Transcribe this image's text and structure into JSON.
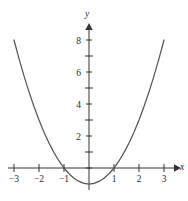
{
  "figure": {
    "background_color": "#ffffff",
    "curve_color": "#555555",
    "axis_color": "#333333",
    "text_color": "#2b2b2b"
  },
  "axes": {
    "x_axis_name": "x",
    "y_axis_name": "y",
    "x_tick_labels": [
      "−3",
      "−2",
      "−1",
      "1",
      "2",
      "3"
    ],
    "y_tick_labels": [
      "2",
      "4",
      "6",
      "8"
    ]
  },
  "top_strip": {
    "faint_cropped_text": "·   ·   ·   · ·   ·   ·"
  },
  "chart_data": {
    "type": "line",
    "title": "",
    "subtitle": "",
    "xlabel": "x",
    "ylabel": "y",
    "equation": "y = x² − 1",
    "xlim": [
      -3.4,
      3.4
    ],
    "ylim": [
      -1.8,
      8.9
    ],
    "xticks": [
      -3,
      -2,
      -1,
      1,
      2,
      3
    ],
    "yticks": [
      2,
      4,
      6,
      8
    ],
    "x_minor_ticks": [],
    "y_minor_ticks": [
      1,
      3,
      5,
      7
    ],
    "grid": false,
    "legend": false,
    "legend_position": "none",
    "x_intercepts": [
      -1,
      1
    ],
    "y_intercept": -1,
    "vertex": [
      0,
      -1
    ],
    "series": [
      {
        "name": "y = x² − 1",
        "x": [
          -3.0,
          -2.8,
          -2.6,
          -2.4,
          -2.2,
          -2.0,
          -1.8,
          -1.6,
          -1.4,
          -1.2,
          -1.0,
          -0.8,
          -0.6,
          -0.4,
          -0.2,
          0.0,
          0.2,
          0.4,
          0.6,
          0.8,
          1.0,
          1.2,
          1.4,
          1.6,
          1.8,
          2.0,
          2.2,
          2.4,
          2.6,
          2.8,
          3.0
        ],
        "values": [
          8.0,
          6.84,
          5.76,
          4.76,
          3.84,
          3.0,
          2.24,
          1.56,
          0.96,
          0.44,
          0.0,
          -0.36,
          -0.64,
          -0.84,
          -0.96,
          -1.0,
          -0.96,
          -0.84,
          -0.64,
          -0.36,
          0.0,
          0.44,
          0.96,
          1.56,
          2.24,
          3.0,
          3.84,
          4.76,
          5.76,
          6.84,
          8.0
        ]
      }
    ]
  }
}
